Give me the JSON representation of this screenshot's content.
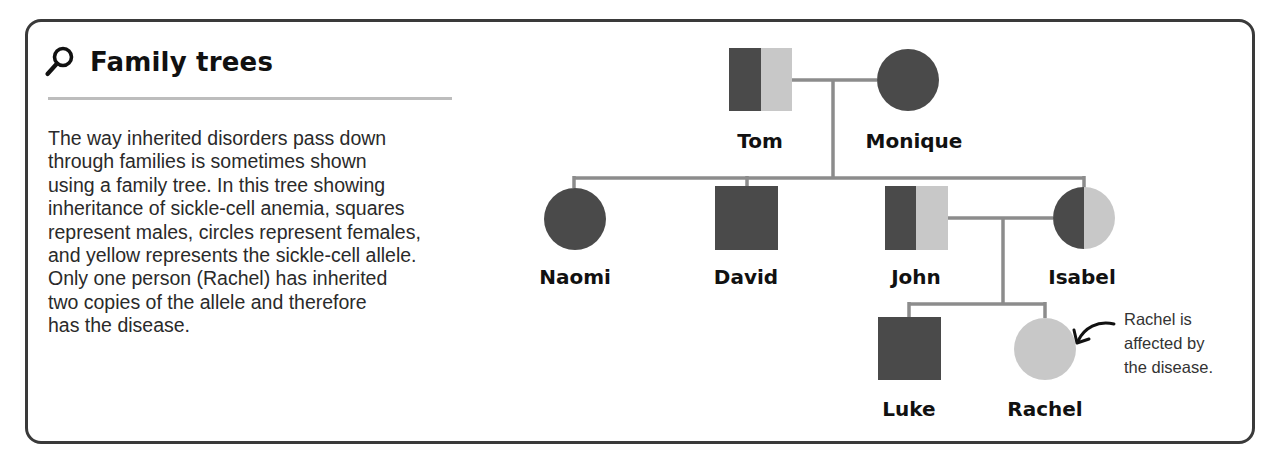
{
  "panel": {
    "title": "Family trees",
    "title_icon": "magnifier-icon",
    "body": "The way inherited disorders pass down\nthrough families is sometimes shown\nusing a family tree. In this tree showing\ninheritance of sickle-cell anemia, squares\nrepresent males, circles represent females,\nand yellow represents the sickle-cell allele.\nOnly one person (Rachel) has inherited\ntwo copies of the allele and therefore\nhas the disease."
  },
  "colors": {
    "normal_allele": "#4a4a4a",
    "sickle_allele": "#c8c8c8",
    "line": "#8c8c8c",
    "border": "#3a3a3a"
  },
  "legend": {
    "square": "male",
    "circle": "female",
    "light_fill": "sickle-cell allele"
  },
  "people": [
    {
      "name": "Tom",
      "sex": "male",
      "genotype": "carrier"
    },
    {
      "name": "Monique",
      "sex": "female",
      "genotype": "unaffected"
    },
    {
      "name": "Naomi",
      "sex": "female",
      "genotype": "unaffected"
    },
    {
      "name": "David",
      "sex": "male",
      "genotype": "unaffected"
    },
    {
      "name": "John",
      "sex": "male",
      "genotype": "carrier"
    },
    {
      "name": "Isabel",
      "sex": "female",
      "genotype": "carrier"
    },
    {
      "name": "Luke",
      "sex": "male",
      "genotype": "unaffected"
    },
    {
      "name": "Rachel",
      "sex": "female",
      "genotype": "affected"
    }
  ],
  "relationships": {
    "couples": [
      [
        "Tom",
        "Monique"
      ],
      [
        "John",
        "Isabel"
      ]
    ],
    "children_of_Tom_Monique": [
      "Naomi",
      "David",
      "Isabel"
    ],
    "children_of_John_Isabel": [
      "Luke",
      "Rachel"
    ]
  },
  "annotation": {
    "target": "Rachel",
    "text": "Rachel is\naffected by\nthe disease."
  }
}
